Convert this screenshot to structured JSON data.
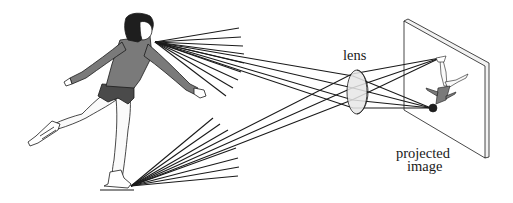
{
  "figure": {
    "labels": {
      "lens": "lens",
      "screen_line1": "projected",
      "screen_line2": "image"
    },
    "colors": {
      "ink": "#1a1a1a",
      "dress": "#7a7a7a",
      "lens_fill": "#e6e6e6",
      "background": "#ffffff"
    },
    "elements": [
      "skater",
      "head-ray-fan",
      "skate-ray-fan",
      "lens",
      "screen",
      "inverted-image"
    ]
  }
}
